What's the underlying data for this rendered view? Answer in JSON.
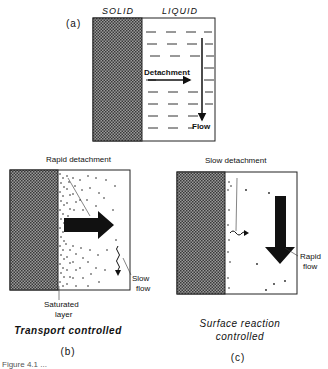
{
  "panel_a": {
    "label": "(a)",
    "header_solid": "SOLID",
    "header_liquid": "LIQUID",
    "arrow_detachment": "Detachment",
    "arrow_flow": "Flow"
  },
  "panel_b": {
    "label": "(b)",
    "annotation_top": "Rapid detachment",
    "annotation_right_line1": "Slow",
    "annotation_right_line2": "flow",
    "annotation_bottom_line1": "Saturated",
    "annotation_bottom_line2": "layer",
    "caption": "Transport controlled"
  },
  "panel_c": {
    "label": "(c)",
    "annotation_top": "Slow detachment",
    "annotation_right_line1": "Rapid",
    "annotation_right_line2": "flow",
    "caption_line1": "Surface reaction",
    "caption_line2": "controlled"
  },
  "figure_caption_partial": "Figure 4.1 ..."
}
